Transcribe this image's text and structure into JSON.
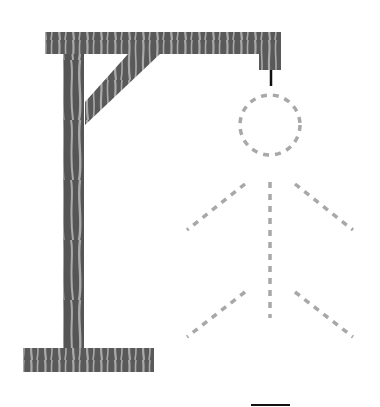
{
  "game": {
    "name": "Hangman",
    "word_blanks": 1,
    "wrong_guesses_drawn": 0,
    "parts": [
      {
        "id": "head",
        "state": "outline"
      },
      {
        "id": "body",
        "state": "outline"
      },
      {
        "id": "left-arm",
        "state": "outline"
      },
      {
        "id": "right-arm",
        "state": "outline"
      },
      {
        "id": "left-leg",
        "state": "outline"
      },
      {
        "id": "right-leg",
        "state": "outline"
      }
    ]
  },
  "colors": {
    "wood_dark": "#555555",
    "wood_light": "#aaaaaa",
    "outline_dash": "#a8a8a8",
    "rope": "#111111",
    "blank": "#111111"
  }
}
